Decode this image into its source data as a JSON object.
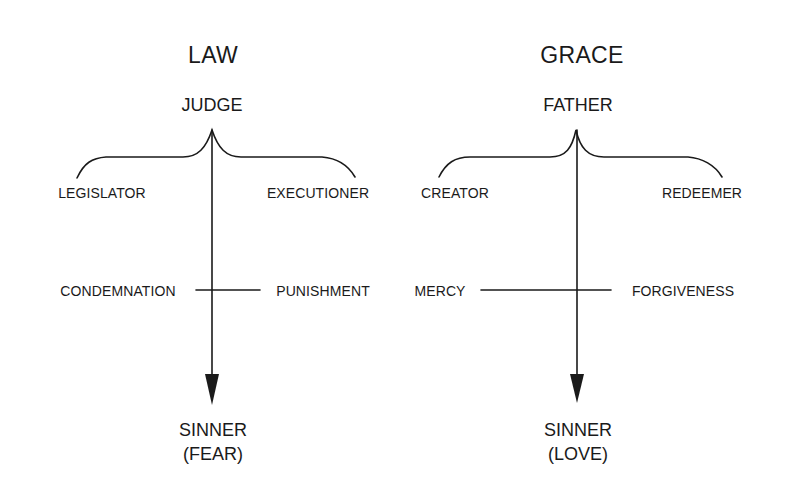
{
  "diagram": {
    "panels": [
      {
        "title": "LAW",
        "head": "JUDGE",
        "roles": {
          "left": "LEGISLATOR",
          "right": "EXECUTIONER"
        },
        "crossbar": {
          "left": "CONDEMNATION",
          "right": "PUNISHMENT"
        },
        "target": {
          "label": "SINNER",
          "response": "(FEAR)"
        }
      },
      {
        "title": "GRACE",
        "head": "FATHER",
        "roles": {
          "left": "CREATOR",
          "right": "REDEEMER"
        },
        "crossbar": {
          "left": "MERCY",
          "right": "FORGIVENESS"
        },
        "target": {
          "label": "SINNER",
          "response": "(LOVE)"
        }
      }
    ],
    "colors": {
      "ink": "#1a1a1a",
      "background": "#ffffff"
    }
  }
}
